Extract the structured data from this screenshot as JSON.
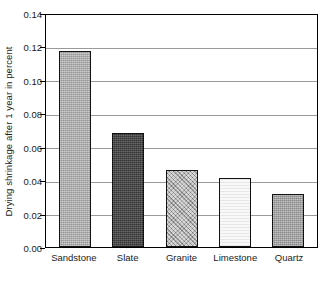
{
  "chart_data": {
    "type": "bar",
    "title": "",
    "subtitle": "",
    "xlabel": "",
    "ylabel": "Drying shrinkage after 1 year in percent",
    "categories": [
      "Sandstone",
      "Slate",
      "Granite",
      "Limestone",
      "Quartz"
    ],
    "values": [
      0.117,
      0.068,
      0.046,
      0.041,
      0.032
    ],
    "series": [
      {
        "name": "Drying shrinkage after 1 year",
        "values": [
          0.117,
          0.068,
          0.046,
          0.041,
          0.032
        ]
      }
    ],
    "ylim": [
      0.0,
      0.14
    ],
    "ytick_step": 0.02,
    "ytick_labels": [
      "0.00",
      "0.02",
      "0.04",
      "0.06",
      "0.08",
      "0.10",
      "0.12",
      "0.14"
    ],
    "ytick_values": [
      0.0,
      0.02,
      0.04,
      0.06,
      0.08,
      0.1,
      0.12,
      0.14
    ],
    "grid": true,
    "grid_axis": "y",
    "legend": false,
    "legend_position": "none",
    "bar_fills": [
      {
        "category": "Sandstone",
        "texture": "tex-sandstone",
        "color": "#a8a8a8"
      },
      {
        "category": "Slate",
        "texture": "tex-slate",
        "color": "#4a4a4a"
      },
      {
        "category": "Granite",
        "texture": "tex-granite",
        "color": "#b4b4b4"
      },
      {
        "category": "Limestone",
        "texture": "tex-limestone",
        "color": "#f2f2f2"
      },
      {
        "category": "Quartz",
        "texture": "tex-quartz",
        "color": "#9f9f9f"
      }
    ],
    "colors": {
      "background": "#ffffff",
      "axis": "#000000",
      "gridline": "#9a9a9a",
      "text": "#1a1a1a",
      "bar_outline": "#121212"
    }
  }
}
